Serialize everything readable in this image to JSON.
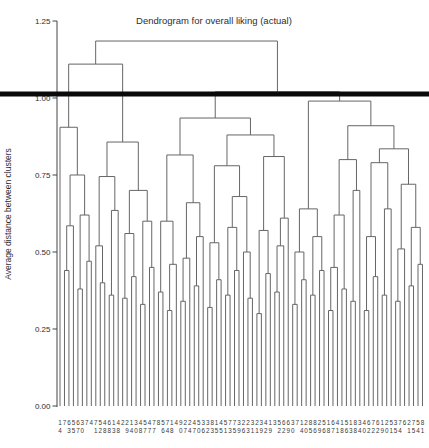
{
  "chart": {
    "title": "Dendrogram for overall liking (actual)",
    "ylabel": "Average distance between clusters"
  },
  "chart_data": {
    "type": "dendrogram",
    "title": "Dendrogram for overall liking (actual)",
    "xlabel": "",
    "ylabel": "Average distance between clusters",
    "ylim": [
      0,
      1.25
    ],
    "yticks": [
      {
        "label": "0.00",
        "value": 0
      },
      {
        "label": "0.25",
        "value": 0.25
      },
      {
        "label": "0.50",
        "value": 0.5
      },
      {
        "label": "0.75",
        "value": 0.75
      },
      {
        "label": "1.00",
        "value": 1.0
      },
      {
        "label": "1.25",
        "value": 1.25
      }
    ],
    "grid": false,
    "legend": null,
    "threshold": 1.0,
    "background_color": "#ffffff",
    "line_color": "#666666",
    "axis_color": "#444444",
    "threshold_color": "#0a0a0a",
    "leaf_count": 82,
    "leaf_label_row1": "1765637475461422134547857149224533814577322323413566371288251641518346761253762758",
    "leaf_label_row2": "4 3570  128838 9408777 648 074706235513596311929 2290 40569687186384022290154 1541",
    "leaf_labels": [
      "14",
      "7",
      "63",
      "55",
      "67",
      "30",
      "7",
      "4",
      "71",
      "52",
      "48",
      "68",
      "13",
      "48",
      "2",
      "29",
      "14",
      "30",
      "48",
      "57",
      "47",
      "77",
      "8",
      "56",
      "74",
      "18",
      "4",
      "90",
      "27",
      "24",
      "47",
      "50",
      "36",
      "32",
      "83",
      "15",
      "45",
      "51",
      "73",
      "75",
      "39",
      "26",
      "23",
      "31",
      "21",
      "39",
      "42",
      "19",
      "3",
      "52",
      "62",
      "69",
      "30",
      "7",
      "14",
      "20",
      "85",
      "86",
      "29",
      "56",
      "18",
      "67",
      "41",
      "18",
      "56",
      "13",
      "88",
      "34",
      "40",
      "62",
      "72",
      "62",
      "19",
      "20",
      "51",
      "35",
      "74",
      "6",
      "21",
      "75",
      "54",
      "81"
    ],
    "root_height": 1.185,
    "tree": [
      1.185,
      [
        1.11,
        [
          0.905,
          0,
          [
            0.75,
            [
              0.585,
              [
                0.44,
                1,
                2
              ],
              3
            ],
            [
              0.62,
              [
                0.38,
                4,
                5
              ],
              [
                0.47,
                6,
                7
              ]
            ]
          ]
        ],
        [
          0.857,
          [
            0.745,
            [
              0.52,
              8,
              [
                0.4,
                9,
                10
              ]
            ],
            [
              0.635,
              [
                0.36,
                11,
                12
              ],
              13
            ]
          ],
          [
            0.7,
            [
              0.56,
              [
                0.35,
                14,
                15
              ],
              [
                0.42,
                16,
                17
              ]
            ],
            [
              0.6,
              [
                0.33,
                18,
                19
              ],
              [
                0.45,
                20,
                21
              ]
            ]
          ]
        ]
      ],
      [
        1.02,
        [
          0.935,
          [
            0.815,
            [
              0.6,
              [
                0.37,
                22,
                23
              ],
              [
                0.46,
                [
                  0.31,
                  24,
                  25
                ],
                26
              ]
            ],
            [
              0.66,
              [
                0.48,
                [
                  0.34,
                  27,
                  28
                ],
                29
              ],
              [
                0.55,
                [
                  0.39,
                  30,
                  31
                ],
                32
              ]
            ]
          ],
          [
            0.88,
            [
              0.78,
              [
                0.53,
                [
                  0.32,
                  33,
                  34
                ],
                [
                  0.41,
                  35,
                  36
                ]
              ],
              [
                0.68,
                [
                  0.58,
                  [
                    0.36,
                    37,
                    38
                  ],
                  [
                    0.44,
                    39,
                    40
                  ]
                ],
                [
                  0.5,
                  41,
                  [
                    0.35,
                    42,
                    43
                  ]
                ]
              ]
            ],
            [
              0.81,
              [
                0.57,
                [
                  0.3,
                  44,
                  45
                ],
                [
                  0.43,
                  46,
                  47
                ]
              ],
              [
                0.61,
                [
                  0.52,
                  [
                    0.37,
                    48,
                    49
                  ],
                  50
                ],
                51
              ]
            ]
          ]
        ],
        [
          0.99,
          [
            0.64,
            [
              0.5,
              [
                0.33,
                52,
                53
              ],
              [
                0.41,
                54,
                55
              ]
            ],
            [
              0.55,
              [
                0.36,
                56,
                57
              ],
              [
                0.44,
                58,
                59
              ]
            ]
          ],
          [
            0.91,
            [
              0.8,
              [
                0.62,
                [
                  0.45,
                  [
                    0.31,
                    60,
                    61
                  ],
                  62
                ],
                [
                  0.38,
                  63,
                  64
                ]
              ],
              [
                0.7,
                [
                  0.34,
                  65,
                  66
                ],
                67
              ]
            ],
            [
              0.835,
              [
                0.79,
                [
                  0.55,
                  [
                    0.31,
                    68,
                    69
                  ],
                  [
                    0.42,
                    70,
                    71
                  ]
                ],
                [
                  0.64,
                  [
                    0.36,
                    72,
                    73
                  ],
                  74
                ]
              ],
              [
                0.72,
                [
                  0.51,
                  [
                    0.34,
                    75,
                    76
                  ],
                  77
                ],
                [
                  0.58,
                  [
                    0.39,
                    78,
                    79
                  ],
                  [
                    0.46,
                    80,
                    81
                  ]
                ]
              ]
            ]
          ]
        ]
      ]
    ]
  }
}
